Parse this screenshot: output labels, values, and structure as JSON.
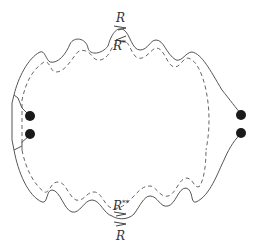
{
  "diagram": {
    "type": "closed-curve-with-corrugated-boundary",
    "labels": {
      "top_outer": "R",
      "top_inner_base": "R",
      "top_inner_sup": "*",
      "bottom_inner_base": "R",
      "bottom_inner_sup": "**",
      "bottom_outer": "R"
    },
    "nodes": {
      "left_count": 2,
      "right_count": 2
    },
    "colors": {
      "stroke": "#555555",
      "dot": "#1a1a1a",
      "background": "#ffffff"
    }
  }
}
